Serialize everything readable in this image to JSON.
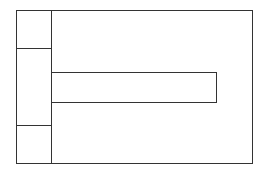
{
  "diagram": {
    "type": "wireframe-layout",
    "stroke_color": "#333333",
    "background": "#ffffff",
    "outer_frame": {
      "x": 16,
      "y": 10,
      "w": 237,
      "h": 154
    },
    "left_column": {
      "divider_x": 51,
      "cells": [
        {
          "name": "top-cell",
          "y_from": 10,
          "y_to": 48
        },
        {
          "name": "middle-cell",
          "y_from": 48,
          "y_to": 125
        },
        {
          "name": "bottom-cell",
          "y_from": 125,
          "y_to": 163
        }
      ]
    },
    "inner_bar": {
      "x": 51,
      "y": 72,
      "w": 166,
      "h": 31
    }
  }
}
